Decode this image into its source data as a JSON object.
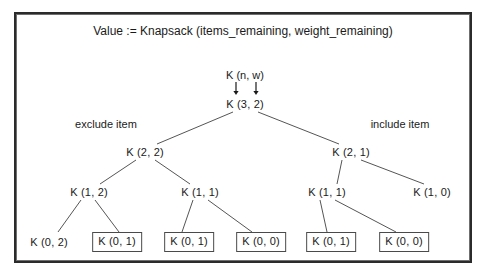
{
  "figure": {
    "title": "Value := Knapsack (items_remaining, weight_remaining)",
    "param_label": "K (n, w)",
    "side_labels": {
      "left": "exclude item",
      "right": "include item"
    },
    "colors": {
      "frame_outer": "#2b2b2b",
      "frame_inner": "#6f6f6f",
      "text": "#1a1a1a",
      "edge": "#555555",
      "box_border": "#4a4a4a",
      "background": "#ffffff"
    }
  },
  "tree": {
    "root": {
      "id": "n_3_2",
      "label": "K (3, 2)",
      "x": 245,
      "y": 104,
      "boxed": false
    },
    "levels": [
      {
        "level": 1,
        "nodes": [
          {
            "id": "n_2_2",
            "label": "K (2, 2)",
            "x": 145,
            "y": 152,
            "boxed": false
          },
          {
            "id": "n_2_1",
            "label": "K (2, 1)",
            "x": 351,
            "y": 152,
            "boxed": false
          }
        ]
      },
      {
        "level": 2,
        "nodes": [
          {
            "id": "n_1_2_a",
            "label": "K (1, 2)",
            "x": 89,
            "y": 192,
            "boxed": false
          },
          {
            "id": "n_1_1_a",
            "label": "K (1, 1)",
            "x": 200,
            "y": 192,
            "boxed": false
          },
          {
            "id": "n_1_1_b",
            "label": "K (1, 1)",
            "x": 327,
            "y": 192,
            "boxed": false
          },
          {
            "id": "n_1_0",
            "label": "K (1, 0)",
            "x": 432,
            "y": 192,
            "boxed": false
          }
        ]
      },
      {
        "level": 3,
        "nodes": [
          {
            "id": "l_0_2",
            "label": "K (0, 2)",
            "x": 49,
            "y": 242,
            "boxed": false
          },
          {
            "id": "l_0_1_a",
            "label": "K (0, 1)",
            "x": 117,
            "y": 242,
            "boxed": true
          },
          {
            "id": "l_0_1_b",
            "label": "K (0, 1)",
            "x": 189,
            "y": 242,
            "boxed": true
          },
          {
            "id": "l_0_0_a",
            "label": "K (0, 0)",
            "x": 261,
            "y": 242,
            "boxed": true
          },
          {
            "id": "l_0_1_c",
            "label": "K (0, 1)",
            "x": 331,
            "y": 242,
            "boxed": true
          },
          {
            "id": "l_0_0_b",
            "label": "K (0, 0)",
            "x": 404,
            "y": 242,
            "boxed": true
          }
        ]
      }
    ],
    "edges": [
      {
        "from": "n_3_2",
        "to": "n_2_2",
        "x1": 233,
        "y1": 112,
        "x2": 157,
        "y2": 144
      },
      {
        "from": "n_3_2",
        "to": "n_2_1",
        "x1": 258,
        "y1": 112,
        "x2": 339,
        "y2": 144
      },
      {
        "from": "n_2_2",
        "to": "n_1_2_a",
        "x1": 136,
        "y1": 160,
        "x2": 100,
        "y2": 184
      },
      {
        "from": "n_2_2",
        "to": "n_1_1_a",
        "x1": 155,
        "y1": 160,
        "x2": 190,
        "y2": 184
      },
      {
        "from": "n_2_1",
        "to": "n_1_1_b",
        "x1": 342,
        "y1": 160,
        "x2": 337,
        "y2": 184
      },
      {
        "from": "n_2_1",
        "to": "n_1_0",
        "x1": 361,
        "y1": 160,
        "x2": 424,
        "y2": 184
      },
      {
        "from": "n_1_2_a",
        "to": "l_0_2",
        "x1": 81,
        "y1": 200,
        "x2": 58,
        "y2": 232
      },
      {
        "from": "n_1_2_a",
        "to": "l_0_1_a",
        "x1": 95,
        "y1": 200,
        "x2": 119,
        "y2": 232
      },
      {
        "from": "n_1_1_a",
        "to": "l_0_1_b",
        "x1": 193,
        "y1": 200,
        "x2": 182,
        "y2": 232
      },
      {
        "from": "n_1_1_a",
        "to": "l_0_0_a",
        "x1": 208,
        "y1": 200,
        "x2": 252,
        "y2": 232
      },
      {
        "from": "n_1_1_b",
        "to": "l_0_1_c",
        "x1": 320,
        "y1": 200,
        "x2": 327,
        "y2": 232
      },
      {
        "from": "n_1_1_b",
        "to": "l_0_0_b",
        "x1": 335,
        "y1": 200,
        "x2": 396,
        "y2": 232
      }
    ],
    "param_arrows": [
      {
        "name": "n-arrow",
        "x": 236,
        "y_top": 82,
        "y_bottom": 95
      },
      {
        "name": "w-arrow",
        "x": 256,
        "y_top": 82,
        "y_bottom": 95
      }
    ],
    "param_label_position": {
      "x": 245,
      "y": 75
    },
    "side_label_positions": {
      "left": {
        "x": 106,
        "y": 124
      },
      "right": {
        "x": 400,
        "y": 124
      }
    }
  }
}
